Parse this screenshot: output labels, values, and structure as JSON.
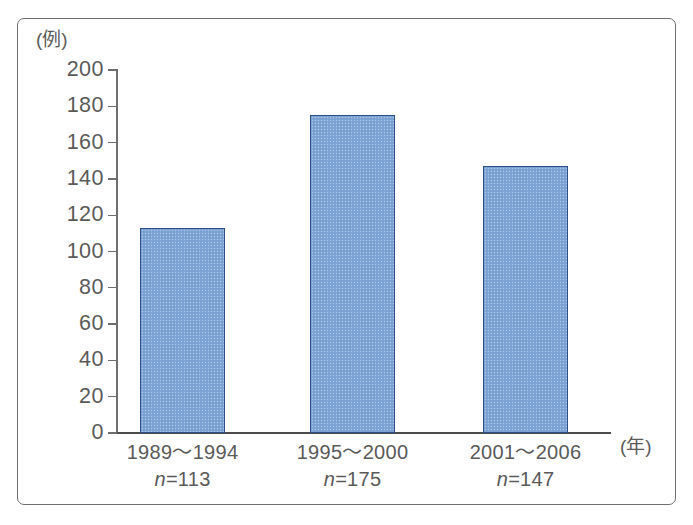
{
  "chart_data": {
    "type": "bar",
    "title": "",
    "subtitle": "",
    "xlabel": "(年)",
    "ylabel": "(例)",
    "categories": [
      "1989〜1994",
      "1995〜2000",
      "2001〜2006"
    ],
    "category_sublabels": [
      "n=113",
      "n=175",
      "n=147"
    ],
    "sample_sizes": [
      113,
      175,
      147
    ],
    "values": [
      113,
      175,
      147
    ],
    "ylim": [
      0,
      200
    ],
    "y_ticks": [
      200,
      180,
      160,
      140,
      120,
      100,
      80,
      60,
      40,
      20,
      0
    ],
    "grid": false,
    "legend": null,
    "bar_fill_color": "#7ea5d6",
    "bar_edge_color": "#2c4f86",
    "axis_color": "#6e6e6e",
    "text_color": "#5a5a5a"
  },
  "figure": {
    "frame_border_color": "#6f6f6f",
    "background_color": "#ffffff",
    "bottom_scan_text": ""
  },
  "axis": {
    "y_unit": "(例)",
    "x_unit": "(年)",
    "n_prefix": "n="
  }
}
